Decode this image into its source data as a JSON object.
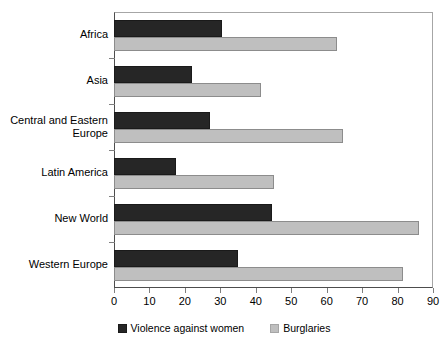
{
  "chart_data": {
    "type": "bar",
    "orientation": "horizontal",
    "title": "",
    "subtitle": "",
    "xlabel": "",
    "ylabel": "",
    "xlim": [
      0,
      90
    ],
    "xticks": [
      0,
      10,
      20,
      30,
      40,
      50,
      60,
      70,
      80,
      90
    ],
    "grid": false,
    "legend_position": "bottom",
    "categories": [
      "Africa",
      "Asia",
      "Central and Eastern\nEurope",
      "Latin America",
      "New World",
      "Western Europe"
    ],
    "series": [
      {
        "name": "Violence against women",
        "color": "#262626",
        "values": [
          30.5,
          22,
          27,
          17.5,
          44.5,
          35
        ]
      },
      {
        "name": "Burglaries",
        "color": "#bfbfbf",
        "values": [
          63,
          41.5,
          64.5,
          45,
          86,
          81.5
        ]
      }
    ]
  },
  "legend": {
    "items": [
      {
        "label": "Violence against women"
      },
      {
        "label": "Burglaries"
      }
    ]
  }
}
